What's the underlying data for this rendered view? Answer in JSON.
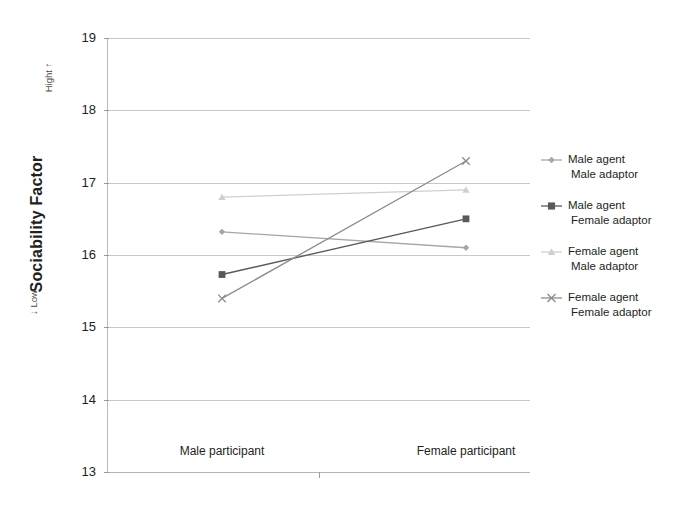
{
  "chart_data": {
    "type": "line",
    "title": "",
    "xlabel": "",
    "ylabel": "Sociability Factor",
    "ylim": [
      13,
      19
    ],
    "yticks": [
      13,
      14,
      15,
      16,
      17,
      18,
      19
    ],
    "grid": true,
    "legend_position": "right",
    "categories": [
      "Male participant",
      "Female participant"
    ],
    "axis_annotations": {
      "high": "Hight ↑",
      "low": "↓ Low"
    },
    "series": [
      {
        "name": "Male agent Male adaptor",
        "legend_line1": "Male agent",
        "legend_line2": "Male adaptor",
        "marker": "diamond",
        "color": "#a6a6a6",
        "values": [
          16.32,
          16.1
        ]
      },
      {
        "name": "Male agent Female adaptor",
        "legend_line1": "Male agent",
        "legend_line2": "Female adaptor",
        "marker": "square",
        "color": "#595959",
        "values": [
          15.73,
          16.5
        ]
      },
      {
        "name": "Female agent Male adaptor",
        "legend_line1": "Female agent",
        "legend_line2": "Male adaptor",
        "marker": "triangle",
        "color": "#cfcfcf",
        "values": [
          16.8,
          16.9
        ]
      },
      {
        "name": "Female agent Female adaptor",
        "legend_line1": "Female agent",
        "legend_line2": "Female adaptor",
        "marker": "cross",
        "color": "#8c8c8c",
        "values": [
          15.4,
          17.3
        ]
      }
    ]
  },
  "axis": {
    "y_labels": [
      "19",
      "18",
      "17",
      "16",
      "15",
      "14",
      "13"
    ],
    "x_labels": [
      "Male participant",
      "Female participant"
    ],
    "y_title_main": "Sociability Factor",
    "y_title_high": "Hight ↑",
    "y_title_low": "↓ Low"
  },
  "legend": {
    "items": [
      {
        "line1": "Male agent",
        "line2": "Male adaptor"
      },
      {
        "line1": "Male agent",
        "line2": "Female adaptor"
      },
      {
        "line1": "Female agent",
        "line2": "Male adaptor"
      },
      {
        "line1": "Female agent",
        "line2": "Female adaptor"
      }
    ]
  },
  "colors": {
    "grid": "#c9c9c9",
    "axis": "#b9b9b9",
    "text": "#231f20"
  }
}
